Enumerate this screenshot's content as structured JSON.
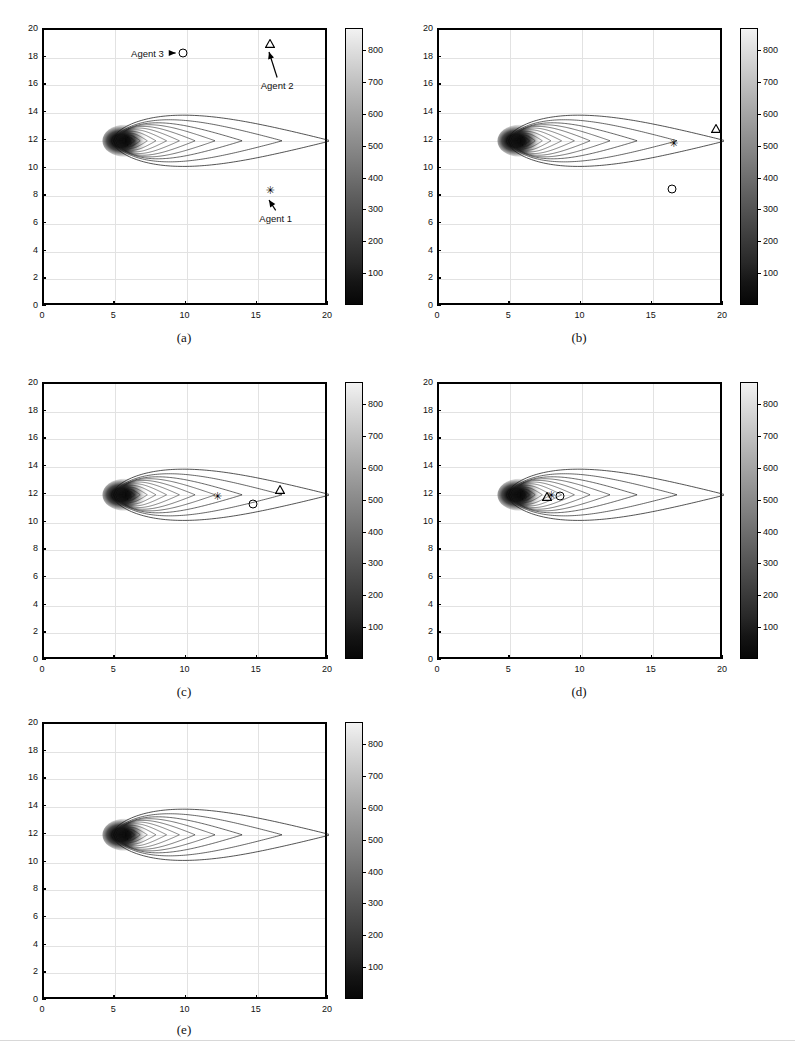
{
  "figure": {
    "type": "multi-panel-contour",
    "panel_count": 5,
    "shared_axes": {
      "xlabel": "",
      "ylabel": "",
      "xlim": [
        0,
        20
      ],
      "ylim": [
        0,
        20
      ],
      "xticks": [
        0,
        5,
        10,
        15,
        20
      ],
      "yticks": [
        0,
        2,
        4,
        6,
        8,
        10,
        12,
        14,
        16,
        18,
        20
      ],
      "xticklabels": [
        "0",
        "5",
        "10",
        "15",
        "20"
      ],
      "yticklabels": [
        "0",
        "2",
        "4",
        "6",
        "8",
        "10",
        "12",
        "14",
        "16",
        "18",
        "20"
      ],
      "grid": true
    },
    "colorbar": {
      "ticks": [
        100,
        200,
        300,
        400,
        500,
        600,
        700,
        800
      ],
      "ticklabels": [
        "100",
        "200",
        "300",
        "400",
        "500",
        "600",
        "700",
        "800"
      ],
      "vmin": 0,
      "vmax": 870,
      "colormap": "grayscale-reversed",
      "low_color": "#060606",
      "high_color": "#f2f2f2",
      "orientation": "vertical"
    }
  },
  "chart_data": {
    "type": "scatter",
    "title": "",
    "xlabel": "",
    "ylabel": "",
    "xlim": [
      0,
      20
    ],
    "ylim": [
      0,
      20
    ],
    "grid": true,
    "legend": "none",
    "colorbar_range": [
      0,
      870
    ],
    "source": {
      "label": "plume source",
      "x": 5.8,
      "y": 12.0,
      "peak_value": 870
    },
    "contour_levels": [
      100,
      200,
      300,
      400,
      500,
      600,
      700,
      800
    ],
    "panels": [
      {
        "id": "a",
        "label": "(a)",
        "annotations": [
          {
            "text": "Agent 3",
            "x": 7.4,
            "y": 18.2,
            "arrow": "right",
            "target_x": 9.9,
            "target_y": 18.2
          },
          {
            "text": "Agent 2",
            "x": 16.5,
            "y": 15.9,
            "arrow": "up-left",
            "target_x": 16.0,
            "target_y": 18.9
          },
          {
            "text": "Agent 1",
            "x": 16.4,
            "y": 6.3,
            "arrow": "up-left",
            "target_x": 16.0,
            "target_y": 8.2
          }
        ],
        "agents": [
          {
            "name": "Agent 1",
            "marker": "star",
            "x": 16.0,
            "y": 8.2
          },
          {
            "name": "Agent 2",
            "marker": "triangle",
            "x": 16.0,
            "y": 18.9
          },
          {
            "name": "Agent 3",
            "marker": "circle",
            "x": 9.9,
            "y": 18.2
          }
        ]
      },
      {
        "id": "b",
        "label": "(b)",
        "annotations": [],
        "agents": [
          {
            "name": "Agent 1",
            "marker": "star",
            "x": 16.6,
            "y": 11.6
          },
          {
            "name": "Agent 2",
            "marker": "triangle",
            "x": 19.6,
            "y": 12.8
          },
          {
            "name": "Agent 3",
            "marker": "circle",
            "x": 16.5,
            "y": 8.4
          }
        ]
      },
      {
        "id": "c",
        "label": "(c)",
        "annotations": [],
        "agents": [
          {
            "name": "Agent 1",
            "marker": "star",
            "x": 12.3,
            "y": 11.7
          },
          {
            "name": "Agent 2",
            "marker": "triangle",
            "x": 16.7,
            "y": 12.3
          },
          {
            "name": "Agent 3",
            "marker": "circle",
            "x": 14.8,
            "y": 11.2
          }
        ]
      },
      {
        "id": "d",
        "label": "(d)",
        "annotations": [],
        "agents": [
          {
            "name": "Agent 1",
            "marker": "star",
            "x": 8.0,
            "y": 11.75
          },
          {
            "name": "Agent 2",
            "marker": "triangle",
            "x": 7.7,
            "y": 11.8
          },
          {
            "name": "Agent 3",
            "marker": "circle",
            "x": 8.6,
            "y": 11.8
          }
        ]
      },
      {
        "id": "e",
        "label": "(e)",
        "annotations": [],
        "agents": []
      }
    ]
  }
}
